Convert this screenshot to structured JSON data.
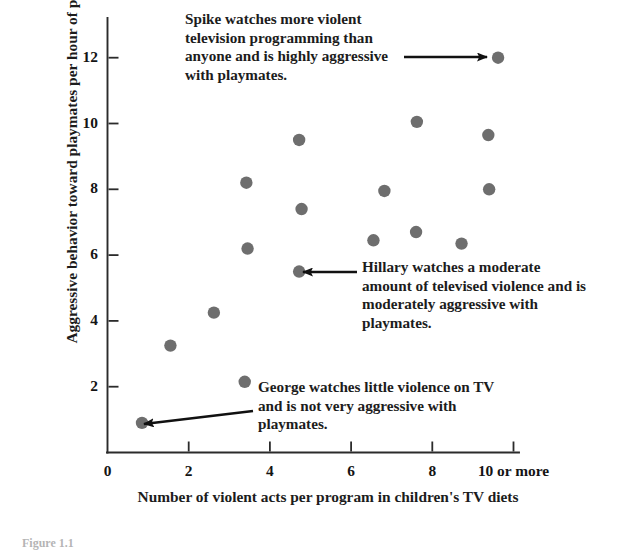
{
  "chart_data": {
    "type": "scatter",
    "title": "",
    "xlabel": "Number of violent acts per program in children's TV diets",
    "ylabel": "Aggressive behavior toward playmates per hour of play",
    "xlim": [
      0,
      10.6
    ],
    "ylim": [
      0,
      13.0
    ],
    "grid": false,
    "legend": "none",
    "xticks": [
      {
        "value": 0,
        "label": "0"
      },
      {
        "value": 2,
        "label": "2"
      },
      {
        "value": 4,
        "label": "4"
      },
      {
        "value": 6,
        "label": "6"
      },
      {
        "value": 8,
        "label": "8"
      },
      {
        "value": 10,
        "label": "10 or more"
      }
    ],
    "yticks": [
      {
        "value": 2,
        "label": "2"
      },
      {
        "value": 4,
        "label": "4"
      },
      {
        "value": 6,
        "label": "6"
      },
      {
        "value": 8,
        "label": "8"
      },
      {
        "value": 10,
        "label": "10"
      },
      {
        "value": 12,
        "label": "12"
      }
    ],
    "point_color": "#6e6e6e",
    "point_radius": 6.2,
    "points": [
      {
        "x": 0.85,
        "y": 0.9,
        "name": "George"
      },
      {
        "x": 1.55,
        "y": 3.25,
        "name": ""
      },
      {
        "x": 2.62,
        "y": 4.25,
        "name": ""
      },
      {
        "x": 3.38,
        "y": 2.15,
        "name": ""
      },
      {
        "x": 3.42,
        "y": 8.2,
        "name": ""
      },
      {
        "x": 3.45,
        "y": 6.2,
        "name": ""
      },
      {
        "x": 4.72,
        "y": 9.5,
        "name": ""
      },
      {
        "x": 4.78,
        "y": 7.4,
        "name": ""
      },
      {
        "x": 4.72,
        "y": 5.5,
        "name": "Hillary"
      },
      {
        "x": 6.55,
        "y": 6.45,
        "name": ""
      },
      {
        "x": 6.82,
        "y": 7.95,
        "name": ""
      },
      {
        "x": 7.62,
        "y": 10.05,
        "name": ""
      },
      {
        "x": 7.6,
        "y": 6.7,
        "name": ""
      },
      {
        "x": 8.72,
        "y": 6.35,
        "name": ""
      },
      {
        "x": 9.38,
        "y": 9.65,
        "name": ""
      },
      {
        "x": 9.4,
        "y": 8.0,
        "name": ""
      },
      {
        "x": 9.62,
        "y": 12.0,
        "name": "Spike"
      }
    ],
    "annotations": [
      {
        "id": "spike",
        "text": "Spike watches more violent television programming than anyone and is highly aggressive with playmates.",
        "target_point": {
          "x": 9.62,
          "y": 12.0
        },
        "arrow_direction": "right"
      },
      {
        "id": "hillary",
        "text": "Hillary watches a moderate amount of televised violence and is moderately aggressive with playmates.",
        "target_point": {
          "x": 4.72,
          "y": 5.5
        },
        "arrow_direction": "left"
      },
      {
        "id": "george",
        "text": "George watches little violence on TV and is not very aggressive with playmates.",
        "target_point": {
          "x": 0.85,
          "y": 0.9
        },
        "arrow_direction": "left-up"
      }
    ]
  },
  "caption": "Figure 1.1"
}
